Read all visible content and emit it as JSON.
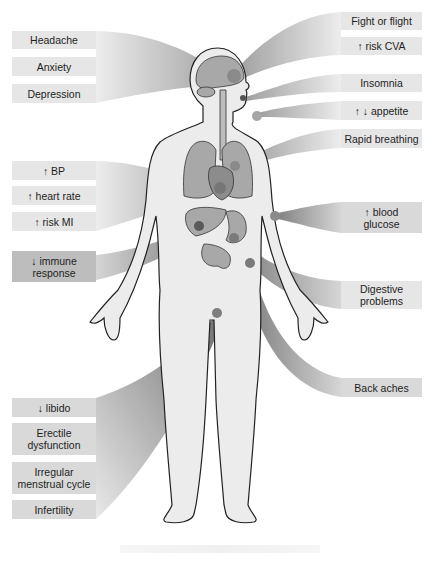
{
  "figure": {
    "colors": {
      "label_bg": "#e6e6e6",
      "label_bg_dark": "#bdbdbd",
      "label_text": "#1e1e1e",
      "body_fill": "#ececec",
      "organ_fill": "#a9a9a9",
      "hotspot": "#8c8c8c",
      "outline": "#222222"
    }
  },
  "labels": {
    "left": [
      {
        "id": "headache",
        "text": "Headache",
        "region": "brain"
      },
      {
        "id": "anxiety",
        "text": "Anxiety",
        "region": "brain"
      },
      {
        "id": "depression",
        "text": "Depression",
        "region": "brain"
      },
      {
        "id": "bp",
        "text": "↑ BP",
        "region": "heart"
      },
      {
        "id": "heart-rate",
        "text": "↑ heart rate",
        "region": "heart"
      },
      {
        "id": "risk-mi",
        "text": "↑ risk MI",
        "region": "heart"
      },
      {
        "id": "immune",
        "text": "↓ immune\nresponse",
        "region": "liver/spleen"
      },
      {
        "id": "libido",
        "text": "↓ libido",
        "region": "reproductive"
      },
      {
        "id": "erectile",
        "text": "Erectile\ndysfunction",
        "region": "reproductive"
      },
      {
        "id": "menstrual",
        "text": "Irregular\nmenstrual cycle",
        "region": "reproductive"
      },
      {
        "id": "infertility",
        "text": "Infertility",
        "region": "reproductive"
      }
    ],
    "right": [
      {
        "id": "fight-flight",
        "text": "Fight or flight",
        "region": "brain"
      },
      {
        "id": "risk-cva",
        "text": "↑ risk CVA",
        "region": "brain"
      },
      {
        "id": "insomnia",
        "text": "Insomnia",
        "region": "eyes"
      },
      {
        "id": "appetite",
        "text": "↑ ↓ appetite",
        "region": "mouth"
      },
      {
        "id": "rapid-breathing",
        "text": "Rapid breathing",
        "region": "lungs"
      },
      {
        "id": "blood-glucose",
        "text": "↑ blood\nglucose",
        "region": "pancreas"
      },
      {
        "id": "digestive",
        "text": "Digestive\nproblems",
        "region": "stomach/intestines"
      },
      {
        "id": "back-aches",
        "text": "Back aches",
        "region": "lower back"
      }
    ]
  }
}
